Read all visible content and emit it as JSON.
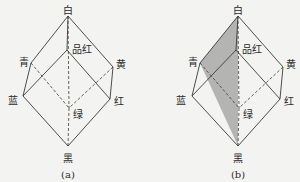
{
  "diagrams": [
    {
      "caption": "(a)",
      "shaded": false,
      "vertices": {
        "white": {
          "label": "白",
          "x": 68,
          "y": 16,
          "lx": 68,
          "ly": 11
        },
        "magenta": {
          "label": "品红",
          "x": 67,
          "y": 50,
          "lx": 82,
          "ly": 50
        },
        "cyan": {
          "label": "青",
          "x": 31,
          "y": 63,
          "lx": 24,
          "ly": 63
        },
        "yellow": {
          "label": "黄",
          "x": 113,
          "y": 67,
          "lx": 121,
          "ly": 65
        },
        "blue": {
          "label": "蓝",
          "x": 23,
          "y": 96,
          "lx": 13,
          "ly": 101
        },
        "red": {
          "label": "红",
          "x": 110,
          "y": 99,
          "lx": 119,
          "ly": 102
        },
        "green": {
          "label": "绿",
          "x": 69,
          "y": 108,
          "lx": 78,
          "ly": 115
        },
        "black": {
          "label": "黑",
          "x": 68,
          "y": 146,
          "lx": 68,
          "ly": 159
        }
      },
      "caption_pos": {
        "x": 68,
        "y": 175
      }
    },
    {
      "caption": "(b)",
      "shaded": true,
      "shade_color": "#a8a8a8",
      "vertices": {
        "white": {
          "label": "白",
          "x": 238,
          "y": 16,
          "lx": 238,
          "ly": 11
        },
        "magenta": {
          "label": "品红",
          "x": 236,
          "y": 50,
          "lx": 252,
          "ly": 50
        },
        "cyan": {
          "label": "青",
          "x": 200,
          "y": 63,
          "lx": 193,
          "ly": 63
        },
        "yellow": {
          "label": "黄",
          "x": 283,
          "y": 67,
          "lx": 291,
          "ly": 65
        },
        "blue": {
          "label": "蓝",
          "x": 192,
          "y": 96,
          "lx": 181,
          "ly": 101
        },
        "red": {
          "label": "红",
          "x": 280,
          "y": 99,
          "lx": 289,
          "ly": 102
        },
        "green": {
          "label": "绿",
          "x": 239,
          "y": 108,
          "lx": 248,
          "ly": 115
        },
        "black": {
          "label": "黑",
          "x": 238,
          "y": 146,
          "lx": 238,
          "ly": 159
        }
      },
      "caption_pos": {
        "x": 238,
        "y": 175
      }
    }
  ],
  "edges_solid": [
    [
      "white",
      "cyan"
    ],
    [
      "white",
      "yellow"
    ],
    [
      "white",
      "magenta"
    ],
    [
      "magenta",
      "blue"
    ],
    [
      "magenta",
      "red"
    ],
    [
      "cyan",
      "blue"
    ],
    [
      "yellow",
      "red"
    ],
    [
      "blue",
      "black"
    ],
    [
      "red",
      "black"
    ]
  ],
  "edges_dashed": [
    [
      "white",
      "green"
    ],
    [
      "cyan",
      "green"
    ],
    [
      "yellow",
      "green"
    ],
    [
      "green",
      "black"
    ]
  ],
  "line_color": "#3a3a3a"
}
